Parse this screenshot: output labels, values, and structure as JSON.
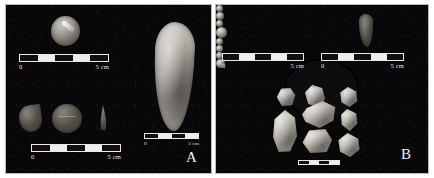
{
  "figure": {
    "type": "archaeological-artifact-photo-plate",
    "background_color": "#ffffff",
    "panel_background_color": "#080808",
    "border_color": "#b9b9b9",
    "artifact_color": "#b8b3aa",
    "scale_text_color": "#e2e2e2",
    "panel_count": 2
  },
  "panels": [
    {
      "id": "a",
      "letter": "A",
      "scalebars": [
        {
          "id": "a-scale-top",
          "zero": "0",
          "max": "5 cm",
          "segments": 5
        },
        {
          "id": "a-scale-bottom",
          "zero": "0",
          "max": "5 cm",
          "segments": 5
        },
        {
          "id": "a-scale-right",
          "zero": "0",
          "max": "5 cm",
          "segments": 4
        }
      ],
      "artifacts": [
        {
          "id": "a-shell",
          "name": "shell-disc-ornament"
        },
        {
          "id": "a-halfdisc",
          "name": "half-disc-fragment"
        },
        {
          "id": "a-disc",
          "name": "round-disc"
        },
        {
          "id": "a-tri",
          "name": "small-triangular-pendant"
        },
        {
          "id": "a-biface",
          "name": "large-leaf-shaped-biface"
        }
      ]
    },
    {
      "id": "b",
      "letter": "B",
      "scalebars": [
        {
          "id": "b-scale-left",
          "zero": "0",
          "max": "5 cm",
          "segments": 5
        },
        {
          "id": "b-scale-right",
          "zero": "0",
          "max": "5 cm",
          "segments": 5
        },
        {
          "id": "b-scale-bottom",
          "zero": "",
          "max": "",
          "segments": 4
        }
      ],
      "beads": [
        {
          "id": "b-bead-1",
          "row": "top",
          "size": "small"
        },
        {
          "id": "b-bead-2",
          "row": "top",
          "size": "small"
        },
        {
          "id": "b-bead-3",
          "row": "top",
          "size": "small"
        },
        {
          "id": "b-bead-4",
          "row": "bottom",
          "size": "large"
        },
        {
          "id": "b-bead-5",
          "row": "bottom",
          "size": "small"
        },
        {
          "id": "b-bead-6",
          "row": "bottom",
          "size": "small"
        },
        {
          "id": "b-bead-7",
          "row": "bottom",
          "size": "small"
        },
        {
          "id": "b-bead-8",
          "row": "bottom",
          "size": "medium"
        }
      ],
      "artifacts": [
        {
          "id": "b-point",
          "name": "small-stone-point"
        }
      ],
      "sherds": [
        {
          "id": "b-sherd-1",
          "name": "pottery-sherd"
        },
        {
          "id": "b-sherd-2",
          "name": "pottery-sherd"
        },
        {
          "id": "b-sherd-3",
          "name": "pottery-sherd"
        },
        {
          "id": "b-sherd-4",
          "name": "pottery-sherd"
        },
        {
          "id": "b-sherd-5",
          "name": "pottery-sherd"
        },
        {
          "id": "b-sherd-6",
          "name": "pottery-sherd"
        },
        {
          "id": "b-sherd-7",
          "name": "pottery-sherd"
        },
        {
          "id": "b-sherd-8",
          "name": "pottery-sherd"
        }
      ]
    }
  ]
}
